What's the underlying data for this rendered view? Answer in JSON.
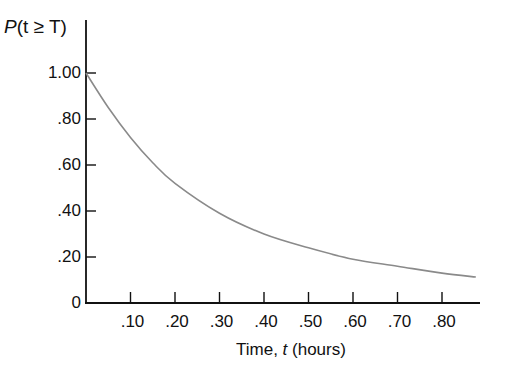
{
  "chart_data": {
    "type": "line",
    "title": "",
    "ylabel": "P(t ≥ T)",
    "xlabel": "Time, t (hours)",
    "xlim": [
      0,
      0.9
    ],
    "ylim": [
      0,
      1.0
    ],
    "grid": false,
    "legend": null,
    "x_ticks": [
      ".10",
      ".20",
      ".30",
      ".40",
      ".50",
      ".60",
      ".70",
      ".80"
    ],
    "y_ticks": [
      "0",
      ".20",
      ".40",
      ".60",
      ".80",
      "1.00"
    ],
    "series": [
      {
        "name": "P(t ≥ T)",
        "x": [
          0.0,
          0.05,
          0.1,
          0.15,
          0.2,
          0.3,
          0.4,
          0.5,
          0.6,
          0.7,
          0.8,
          0.876
        ],
        "values": [
          1.0,
          0.85,
          0.72,
          0.61,
          0.52,
          0.39,
          0.3,
          0.24,
          0.19,
          0.16,
          0.13,
          0.113
        ]
      }
    ]
  },
  "labels": {
    "y_prefix": "P",
    "y_var": "(t ≥ T)",
    "x_title": "Time, ",
    "x_var": "t",
    "x_unit": " (hours)"
  }
}
